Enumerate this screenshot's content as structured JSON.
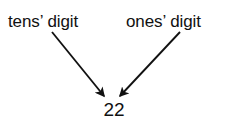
{
  "figure": {
    "type": "annotated-number-diagram",
    "background_color": "#ffffff",
    "ink_color": "#111111",
    "labels": {
      "tens": "tens’ digit",
      "ones": "ones’ digit"
    },
    "value": "22",
    "arrows": [
      {
        "name": "tens-arrow",
        "from_label": "tens’ digit",
        "points_to_digit": "tens",
        "x1": 52,
        "y1": 32,
        "x2": 104,
        "y2": 96
      },
      {
        "name": "ones-arrow",
        "from_label": "ones’ digit",
        "points_to_digit": "ones",
        "x1": 180,
        "y1": 32,
        "x2": 120,
        "y2": 96
      }
    ]
  }
}
